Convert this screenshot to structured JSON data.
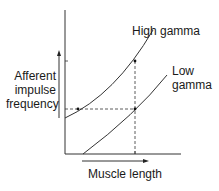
{
  "diagram": {
    "y_label_lines": [
      "Afferent",
      "impulse",
      "frequency"
    ],
    "x_label": "Muscle length",
    "curves": [
      {
        "name": "High gamma",
        "label_lines": [
          "High gamma"
        ]
      },
      {
        "name": "Low gamma",
        "label_lines": [
          "Low",
          "gamma"
        ]
      }
    ],
    "colors": {
      "line": "#1a1a1a",
      "background": "#ffffff"
    }
  }
}
